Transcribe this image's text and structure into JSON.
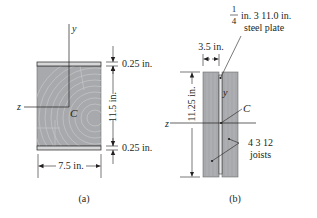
{
  "figure_a": {
    "axis_y": "y",
    "axis_z": "z",
    "centroid": "C",
    "dim_top_plate": "0.25 in.",
    "dim_height": "11.5 in.",
    "dim_bottom_plate": "0.25 in.",
    "dim_width": "7.5 in.",
    "caption": "(a)"
  },
  "figure_b": {
    "plate_frac_num": "1",
    "plate_frac_den": "4",
    "plate_label_line1": "in. 3 11.0 in.",
    "plate_label_line2": "steel plate",
    "dim_width": "3.5 in.",
    "dim_height": "11.25 in.",
    "axis_y": "y",
    "axis_z": "z",
    "centroid": "C",
    "joist_label_line1": "4 3 12",
    "joist_label_line2": "joists",
    "caption": "(b)"
  },
  "colors": {
    "wood": "#a7a9ac",
    "wood_grain": "#c8c9cb",
    "plate": "#d8d9da",
    "line": "#231f20"
  }
}
